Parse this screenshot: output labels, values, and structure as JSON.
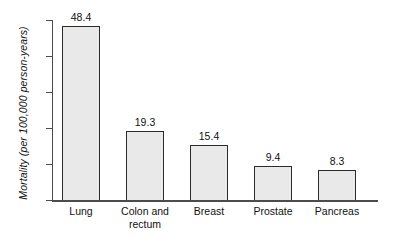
{
  "chart_data": {
    "type": "bar",
    "title": "",
    "xlabel": "",
    "ylabel": "Mortality (per 100,000 person-years)",
    "categories": [
      "Lung",
      "Colon and\nrectum",
      "Breast",
      "Prostate",
      "Pancreas"
    ],
    "values": [
      48.4,
      19.3,
      15.4,
      9.4,
      8.3
    ],
    "value_labels": [
      "48.4",
      "19.3",
      "15.4",
      "9.4",
      "8.3"
    ],
    "ylim": [
      0,
      50
    ],
    "yticks": [
      0,
      10,
      20,
      30,
      40,
      50
    ],
    "ytick_labels": [
      "0",
      "10",
      "20",
      "30",
      "40",
      "50"
    ],
    "grid": false,
    "legend": null,
    "bar_fill_color": "#e9e9e9",
    "bar_edge_color": "#2b2b2b",
    "axis_color": "#4c4c4c"
  },
  "axis": {
    "y_title": "Mortality (per 100,000 person-years)"
  }
}
